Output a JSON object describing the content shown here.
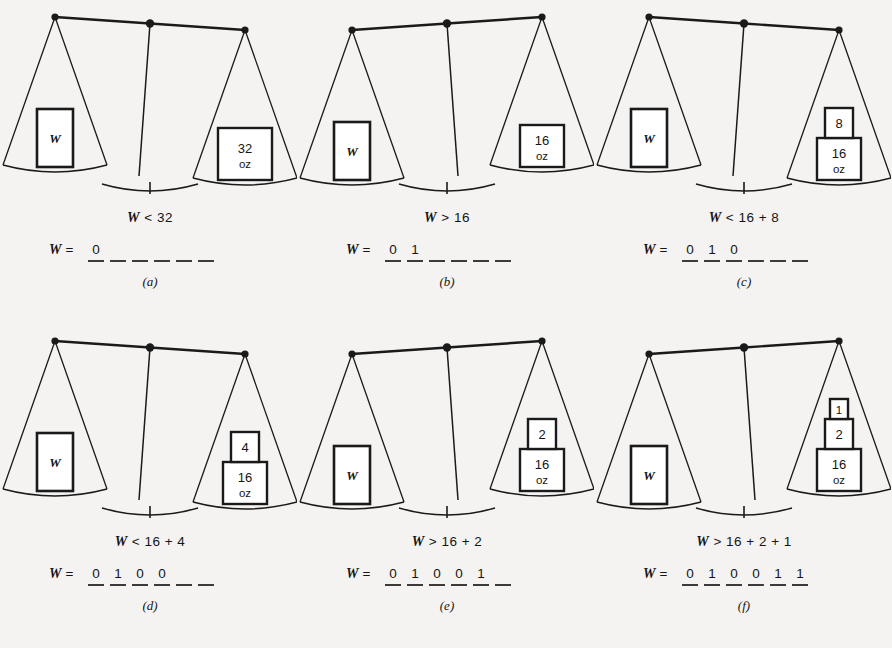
{
  "figure": {
    "background_color": "#f4f3f1",
    "ink_color": "#1a1a1a",
    "unknown_label": "W",
    "unit_label": "oz",
    "equals_prefix": "W ="
  },
  "panels": [
    {
      "id": "a",
      "caption": "(a)",
      "comparison": "W < 32",
      "tilt": "right-down",
      "left_pan": {
        "box_label": "W"
      },
      "right_pan": {
        "weights": [
          {
            "value": "32",
            "unit": "oz",
            "size": "large"
          }
        ]
      },
      "binary": {
        "prefix": "W =",
        "digits": [
          "0",
          "",
          "",
          "",
          "",
          ""
        ],
        "known_count": 1,
        "total_slots": 6
      }
    },
    {
      "id": "b",
      "caption": "(b)",
      "comparison": "W > 16",
      "tilt": "left-down",
      "left_pan": {
        "box_label": "W"
      },
      "right_pan": {
        "weights": [
          {
            "value": "16",
            "unit": "oz",
            "size": "medium"
          }
        ]
      },
      "binary": {
        "prefix": "W =",
        "digits": [
          "0",
          "1",
          "",
          "",
          "",
          ""
        ],
        "known_count": 2,
        "total_slots": 6
      }
    },
    {
      "id": "c",
      "caption": "(c)",
      "comparison": "W < 16 + 8",
      "tilt": "right-down",
      "left_pan": {
        "box_label": "W"
      },
      "right_pan": {
        "weights": [
          {
            "value": "8",
            "unit": "",
            "size": "small"
          },
          {
            "value": "16",
            "unit": "oz",
            "size": "medium"
          }
        ]
      },
      "binary": {
        "prefix": "W =",
        "digits": [
          "0",
          "1",
          "0",
          "",
          "",
          ""
        ],
        "known_count": 3,
        "total_slots": 6
      }
    },
    {
      "id": "d",
      "caption": "(d)",
      "comparison": "W < 16 + 4",
      "tilt": "right-down",
      "left_pan": {
        "box_label": "W"
      },
      "right_pan": {
        "weights": [
          {
            "value": "4",
            "unit": "",
            "size": "small"
          },
          {
            "value": "16",
            "unit": "oz",
            "size": "medium"
          }
        ]
      },
      "binary": {
        "prefix": "W =",
        "digits": [
          "0",
          "1",
          "0",
          "0",
          "",
          ""
        ],
        "known_count": 4,
        "total_slots": 6
      }
    },
    {
      "id": "e",
      "caption": "(e)",
      "comparison": "W > 16 + 2",
      "tilt": "left-down",
      "left_pan": {
        "box_label": "W"
      },
      "right_pan": {
        "weights": [
          {
            "value": "2",
            "unit": "",
            "size": "small"
          },
          {
            "value": "16",
            "unit": "oz",
            "size": "medium"
          }
        ]
      },
      "binary": {
        "prefix": "W =",
        "digits": [
          "0",
          "1",
          "0",
          "0",
          "1",
          ""
        ],
        "known_count": 5,
        "total_slots": 6
      }
    },
    {
      "id": "f",
      "caption": "(f)",
      "comparison": "W > 16 + 2 + 1",
      "tilt": "left-down",
      "left_pan": {
        "box_label": "W"
      },
      "right_pan": {
        "weights": [
          {
            "value": "1",
            "unit": "",
            "size": "tiny"
          },
          {
            "value": "2",
            "unit": "",
            "size": "small"
          },
          {
            "value": "16",
            "unit": "oz",
            "size": "medium"
          }
        ]
      },
      "binary": {
        "prefix": "W =",
        "digits": [
          "0",
          "1",
          "0",
          "0",
          "1",
          "1"
        ],
        "known_count": 6,
        "total_slots": 6
      }
    }
  ]
}
